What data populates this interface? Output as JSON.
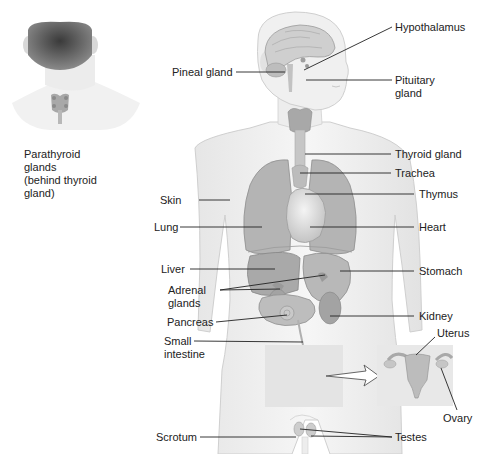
{
  "figure": {
    "inset_back_view": {
      "label_lines": [
        "Parathyroid",
        "glands",
        "(behind thyroid",
        "gland)"
      ]
    },
    "labels_left": [
      {
        "id": "pineal",
        "text": "Pineal gland"
      },
      {
        "id": "skin",
        "text": "Skin"
      },
      {
        "id": "lung",
        "text": "Lung"
      },
      {
        "id": "liver",
        "text": "Liver"
      },
      {
        "id": "adrenal",
        "lines": [
          "Adrenal",
          "glands"
        ]
      },
      {
        "id": "pancreas",
        "text": "Pancreas"
      },
      {
        "id": "small_intestine",
        "lines": [
          "Small",
          "intestine"
        ]
      },
      {
        "id": "scrotum",
        "text": "Scrotum"
      }
    ],
    "labels_right": [
      {
        "id": "hypothalamus",
        "text": "Hypothalamus"
      },
      {
        "id": "pituitary",
        "lines": [
          "Pituitary",
          "gland"
        ]
      },
      {
        "id": "thyroid",
        "text": "Thyroid gland"
      },
      {
        "id": "trachea",
        "text": "Trachea"
      },
      {
        "id": "thymus",
        "text": "Thymus"
      },
      {
        "id": "heart",
        "text": "Heart"
      },
      {
        "id": "stomach",
        "text": "Stomach"
      },
      {
        "id": "kidney",
        "text": "Kidney"
      },
      {
        "id": "uterus",
        "text": "Uterus"
      },
      {
        "id": "ovary",
        "text": "Ovary"
      },
      {
        "id": "testes",
        "text": "Testes"
      }
    ],
    "colors": {
      "skin_fill": "#efefef",
      "skin_stroke": "#c8c8c8",
      "organ_fill": "#b8b8b8",
      "organ_dark": "#9a9a9a",
      "organ_light": "#d4d4d4",
      "hair": "#555555",
      "leader_line": "#222222",
      "pelvis_box": "#e4e4e4"
    }
  }
}
